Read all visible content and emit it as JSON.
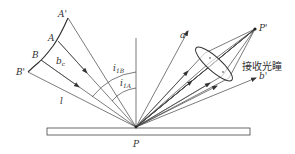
{
  "diagram": {
    "labels": {
      "A_prime": "A'",
      "A": "A",
      "B": "B",
      "B_prime": "B'",
      "b_c": "b",
      "b_c_sub": "c",
      "l": "l",
      "i_1B": "i",
      "i_1B_sub": "1B",
      "i_1A": "i",
      "i_1A_sub": "1A",
      "a_prime": "a'",
      "b_prime": "b'",
      "P": "P",
      "P_prime": "P'",
      "receiver_lens": "接收光瞳"
    },
    "colors": {
      "line": "#444444",
      "text": "#333333",
      "background": "#ffffff"
    }
  }
}
